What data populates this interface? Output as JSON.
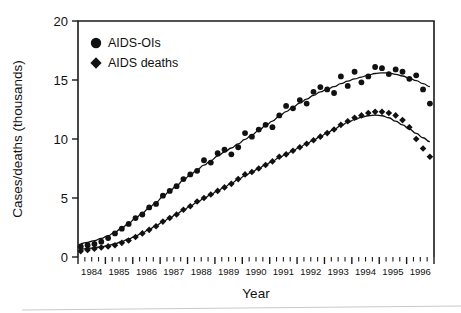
{
  "chart_data": {
    "type": "scatter",
    "title": "",
    "xlabel": "Year",
    "ylabel": "Cases/deaths (thousands)",
    "xlim": [
      1984.0,
      1997.0
    ],
    "ylim": [
      0,
      20
    ],
    "yticks": [
      0,
      5,
      10,
      15,
      20
    ],
    "xticks": [
      1984,
      1985,
      1986,
      1987,
      1988,
      1989,
      1990,
      1991,
      1992,
      1993,
      1994,
      1995,
      1996
    ],
    "xtick_labels": [
      "1984",
      "1985",
      "1986",
      "1987",
      "1988",
      "1989",
      "1990",
      "1991",
      "1992",
      "1993",
      "1994",
      "1995",
      "1996"
    ],
    "minor_ticks_per_year": 4,
    "grid": false,
    "legend_position": "top-left",
    "series": [
      {
        "name": "AIDS-OIs",
        "marker": "circle",
        "color": "#111111",
        "has_trend_line": true,
        "x": [
          1984.1,
          1984.35,
          1984.6,
          1984.85,
          1985.1,
          1985.35,
          1985.6,
          1985.85,
          1986.1,
          1986.35,
          1986.6,
          1986.85,
          1987.1,
          1987.35,
          1987.6,
          1987.85,
          1988.1,
          1988.35,
          1988.6,
          1988.85,
          1989.1,
          1989.35,
          1989.6,
          1989.85,
          1990.1,
          1990.35,
          1990.6,
          1990.85,
          1991.1,
          1991.35,
          1991.6,
          1991.85,
          1992.1,
          1992.35,
          1992.6,
          1992.85,
          1993.1,
          1993.35,
          1993.6,
          1993.85,
          1994.1,
          1994.35,
          1994.6,
          1994.85,
          1995.1,
          1995.35,
          1995.6,
          1995.85,
          1996.1,
          1996.35,
          1996.6,
          1996.85
        ],
        "y": [
          0.9,
          1.0,
          1.1,
          1.3,
          1.6,
          2.0,
          2.4,
          2.8,
          3.3,
          3.6,
          4.2,
          4.5,
          5.2,
          5.6,
          6.0,
          6.6,
          7.0,
          7.3,
          8.2,
          8.0,
          8.8,
          9.1,
          8.7,
          9.3,
          10.5,
          10.2,
          10.8,
          11.2,
          11.0,
          12.0,
          12.8,
          12.6,
          13.3,
          13.0,
          14.0,
          14.4,
          14.2,
          13.9,
          15.3,
          14.5,
          15.7,
          14.8,
          15.3,
          16.1,
          16.0,
          15.5,
          15.9,
          15.7,
          15.1,
          15.4,
          14.2,
          13.0
        ]
      },
      {
        "name": "AIDS deaths",
        "marker": "diamond",
        "color": "#111111",
        "has_trend_line": true,
        "x": [
          1984.1,
          1984.35,
          1984.6,
          1984.85,
          1985.1,
          1985.35,
          1985.6,
          1985.85,
          1986.1,
          1986.35,
          1986.6,
          1986.85,
          1987.1,
          1987.35,
          1987.6,
          1987.85,
          1988.1,
          1988.35,
          1988.6,
          1988.85,
          1989.1,
          1989.35,
          1989.6,
          1989.85,
          1990.1,
          1990.35,
          1990.6,
          1990.85,
          1991.1,
          1991.35,
          1991.6,
          1991.85,
          1992.1,
          1992.35,
          1992.6,
          1992.85,
          1993.1,
          1993.35,
          1993.6,
          1993.85,
          1994.1,
          1994.35,
          1994.6,
          1994.85,
          1995.1,
          1995.35,
          1995.6,
          1995.85,
          1996.1,
          1996.35,
          1996.6,
          1996.85
        ],
        "y": [
          0.5,
          0.6,
          0.7,
          0.8,
          0.9,
          1.0,
          1.2,
          1.4,
          1.7,
          2.0,
          2.3,
          2.6,
          3.0,
          3.3,
          3.6,
          4.0,
          4.3,
          4.7,
          5.0,
          5.3,
          5.6,
          5.9,
          6.2,
          6.6,
          7.0,
          7.2,
          7.5,
          7.8,
          8.1,
          8.5,
          8.7,
          9.0,
          9.3,
          9.6,
          9.9,
          10.2,
          10.5,
          10.8,
          11.2,
          11.5,
          11.8,
          12.0,
          12.2,
          12.3,
          12.3,
          12.2,
          12.0,
          11.6,
          11.0,
          10.0,
          9.2,
          8.5
        ]
      }
    ]
  },
  "legend": {
    "entries": [
      {
        "label": "AIDS-OIs",
        "marker": "circle"
      },
      {
        "label": "AIDS deaths",
        "marker": "diamond"
      }
    ]
  },
  "axes": {
    "y_title": "Cases/deaths (thousands)",
    "x_title": "Year",
    "y_labels": [
      "20",
      "15",
      "10",
      "5",
      "0"
    ],
    "x_labels": [
      "1984",
      "1985",
      "1986",
      "1987",
      "1988",
      "1989",
      "1990",
      "1991",
      "1992",
      "1993",
      "1994",
      "1995",
      "1996"
    ]
  }
}
